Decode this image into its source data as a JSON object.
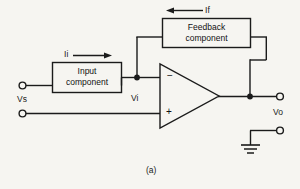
{
  "figure": {
    "caption": "(a)",
    "type": "op-amp feedback amplifier block diagram"
  },
  "blocks": {
    "input": {
      "line1": "Input",
      "line2": "component"
    },
    "feedback": {
      "line1": "Feedback",
      "line2": "component"
    }
  },
  "labels": {
    "source_voltage": "Vs",
    "input_voltage": "Vi",
    "output_voltage": "Vo",
    "input_current": "Ii",
    "feedback_current": "If",
    "inverting_input": "−",
    "noninverting_input": "+"
  },
  "colors": {
    "background": "#f6f5f1",
    "wire": "#1b1b1b",
    "text": "#1b1b1b"
  }
}
